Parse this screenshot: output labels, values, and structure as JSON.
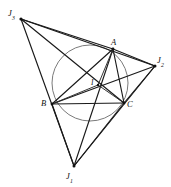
{
  "figure": {
    "type": "geometry-diagram",
    "canvas": {
      "width": 171,
      "height": 187,
      "background": "#ffffff"
    },
    "stroke_color": "#1a1a1a",
    "circle_color": "#6b6b6b",
    "points": [
      {
        "id": "A",
        "label": "A",
        "sub": "",
        "x": 113,
        "y": 49,
        "role": "triangle-vertex"
      },
      {
        "id": "B",
        "label": "B",
        "sub": "",
        "x": 52,
        "y": 104,
        "role": "triangle-vertex"
      },
      {
        "id": "C",
        "label": "C",
        "sub": "",
        "x": 124,
        "y": 103,
        "role": "triangle-vertex"
      },
      {
        "id": "I",
        "label": "I",
        "sub": "",
        "x": 98,
        "y": 85,
        "role": "incenter"
      },
      {
        "id": "J1",
        "label": "J",
        "sub": "1",
        "x": 74,
        "y": 166,
        "role": "excenter"
      },
      {
        "id": "J2",
        "label": "J",
        "sub": "2",
        "x": 155,
        "y": 66,
        "role": "excenter"
      },
      {
        "id": "J3",
        "label": "J",
        "sub": "3",
        "x": 21,
        "y": 19,
        "role": "excenter"
      }
    ],
    "incircle": {
      "cx": 90,
      "cy": 83,
      "r": 38,
      "label": "incircle"
    },
    "segments": [
      {
        "from": "A",
        "to": "B",
        "name": "side-AB"
      },
      {
        "from": "B",
        "to": "C",
        "name": "side-BC"
      },
      {
        "from": "C",
        "to": "A",
        "name": "side-CA"
      },
      {
        "from": "I",
        "to": "A",
        "name": "inradius-IA"
      },
      {
        "from": "I",
        "to": "B",
        "name": "inradius-IB"
      },
      {
        "from": "I",
        "to": "C",
        "name": "inradius-IC"
      },
      {
        "from": "J1",
        "to": "J2",
        "name": "excentral-J1-J2"
      },
      {
        "from": "J2",
        "to": "J3",
        "name": "excentral-J2-J3"
      },
      {
        "from": "J3",
        "to": "J1",
        "name": "excentral-J3-J1"
      },
      {
        "from": "J1",
        "to": "A",
        "name": "bisector-J1-A"
      },
      {
        "from": "J2",
        "to": "B",
        "name": "bisector-J2-B"
      },
      {
        "from": "J3",
        "to": "C",
        "name": "bisector-J3-C"
      },
      {
        "from": "J1",
        "to": "C",
        "name": "chord-J1-C"
      },
      {
        "from": "J2",
        "to": "C",
        "name": "chord-J2-C"
      },
      {
        "from": "J2",
        "to": "A",
        "name": "chord-J2-A"
      },
      {
        "from": "J3",
        "to": "A",
        "name": "chord-J3-A"
      },
      {
        "from": "J3",
        "to": "B",
        "name": "chord-J3-B"
      },
      {
        "from": "J1",
        "to": "B",
        "name": "chord-J1-B"
      }
    ]
  }
}
